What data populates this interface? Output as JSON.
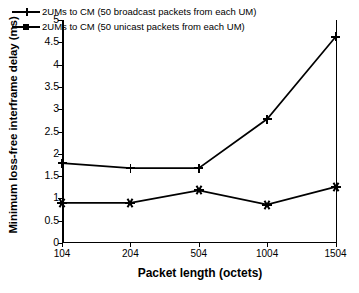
{
  "chart_data": {
    "type": "line",
    "title": "",
    "xlabel": "Packet length (octets)",
    "ylabel": "Minimum loss-free interframe delay (ms)",
    "categories": [
      "104",
      "204",
      "504",
      "1004",
      "1504"
    ],
    "x": [
      104,
      204,
      504,
      1004,
      1504
    ],
    "ylim": [
      0,
      5
    ],
    "yticks": [
      "0",
      "0.5",
      "1",
      "1.5",
      "2",
      "2.5",
      "3",
      "3.5",
      "4",
      "4.5",
      "5"
    ],
    "ytick_values": [
      0,
      0.5,
      1,
      1.5,
      2,
      2.5,
      3,
      3.5,
      4,
      4.5,
      5
    ],
    "grid": false,
    "legend_position": "top-left-inside",
    "series": [
      {
        "name": "2UMs to CM (50 broadcast packets from each UM)",
        "marker": "plus",
        "color": "#000000",
        "values": [
          1.79,
          1.68,
          1.68,
          2.78,
          4.62
        ]
      },
      {
        "name": "2UMs to CM (50 unicast packets from each UM)",
        "marker": "square",
        "color": "#000000",
        "values": [
          0.9,
          0.9,
          1.18,
          0.86,
          1.26
        ]
      }
    ]
  }
}
